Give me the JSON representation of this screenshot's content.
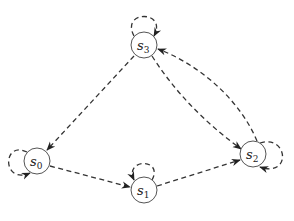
{
  "diagram": {
    "type": "state-transition-graph",
    "edge_style": "dashed",
    "nodes": [
      {
        "id": "s0",
        "label": "s",
        "subscript": "0",
        "cx": 37,
        "cy": 161
      },
      {
        "id": "s1",
        "label": "s",
        "subscript": "1",
        "cx": 144,
        "cy": 190
      },
      {
        "id": "s2",
        "label": "s",
        "subscript": "2",
        "cx": 253,
        "cy": 154
      },
      {
        "id": "s3",
        "label": "s",
        "subscript": "3",
        "cx": 144,
        "cy": 45
      }
    ],
    "edges": [
      {
        "from": "s3",
        "to": "s0"
      },
      {
        "from": "s3",
        "to": "s2"
      },
      {
        "from": "s2",
        "to": "s3"
      },
      {
        "from": "s0",
        "to": "s1"
      },
      {
        "from": "s1",
        "to": "s2"
      },
      {
        "from": "s0",
        "to": "s0",
        "loop": "left"
      },
      {
        "from": "s1",
        "to": "s1",
        "loop": "top"
      },
      {
        "from": "s2",
        "to": "s2",
        "loop": "right"
      },
      {
        "from": "s3",
        "to": "s3",
        "loop": "top"
      }
    ],
    "colors": {
      "stroke": "#333333",
      "node_border": "#555555",
      "background": "#ffffff"
    }
  }
}
